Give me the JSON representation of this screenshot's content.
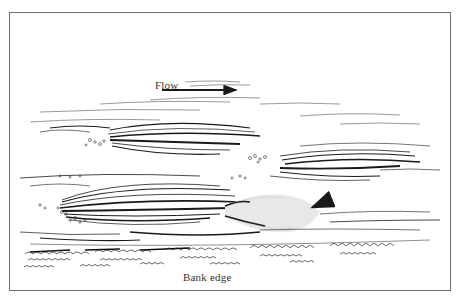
{
  "figure": {
    "type": "pen-and-ink illustration",
    "labels": {
      "flow": "Flow",
      "bank_edge": "Bank edge"
    },
    "arrows": [
      {
        "name": "flow-direction-arrow",
        "direction": "right",
        "position": "top-center"
      },
      {
        "name": "counter-current-arrow",
        "direction": "down-left",
        "position": "lower-right, pointing at spray plume"
      }
    ],
    "elements": [
      "water streamlines",
      "three streaked eddy bodies",
      "bubble clusters",
      "spray/foam plume",
      "grass tufts along bank"
    ],
    "colors": {
      "ink": "#1a1a1a",
      "frame": "#6e6e6e",
      "background": "#ffffff"
    }
  }
}
